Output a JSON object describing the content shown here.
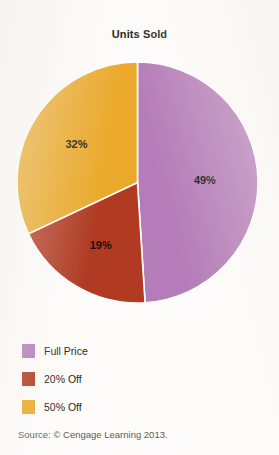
{
  "chart_data": {
    "type": "pie",
    "title": "Units Sold",
    "categories": [
      "Full Price",
      "20% Off",
      "50% Off"
    ],
    "values": [
      49,
      19,
      32
    ],
    "value_labels": [
      "49%",
      "19%",
      "32%"
    ],
    "colors": [
      "#b47cb8",
      "#b03a22",
      "#eaa92a"
    ],
    "start_angle_deg": 0,
    "direction": "clockwise",
    "slice_separator_color": "#ffffff",
    "legend_position": "bottom-left",
    "xlabel": "",
    "ylabel": "",
    "slices": [
      {
        "label": "Full Price",
        "value": 49,
        "display": "49%",
        "color": "#b47cb8"
      },
      {
        "label": "20% Off",
        "value": 19,
        "display": "19%",
        "color": "#b03a22"
      },
      {
        "label": "50% Off",
        "value": 32,
        "display": "32%",
        "color": "#eaa92a"
      }
    ]
  },
  "figure": {
    "title": "Units Sold",
    "background_color": "#fdfcfa"
  },
  "legend": {
    "items": [
      {
        "label": "Full Price",
        "color": "#b47cb8"
      },
      {
        "label": "20% Off",
        "color": "#b03a22"
      },
      {
        "label": "50% Off",
        "color": "#eaa92a"
      }
    ]
  },
  "source": {
    "text": "Source: © Cengage Learning 2013."
  }
}
